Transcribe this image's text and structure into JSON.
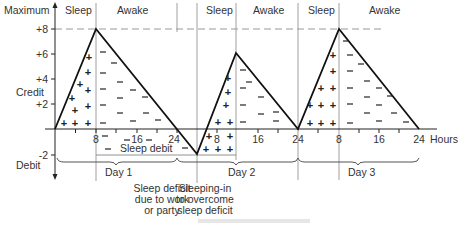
{
  "diagram": {
    "y_axis": {
      "top_label": "Maximum",
      "credit_label": "Credit",
      "debit_label": "Debit",
      "ticks": [
        {
          "label": "+8",
          "value": 8
        },
        {
          "label": "+6",
          "value": 6
        },
        {
          "label": "+4",
          "value": 4
        },
        {
          "label": "+2",
          "value": 2
        },
        {
          "label": "-2",
          "value": -2
        }
      ]
    },
    "x_axis": {
      "unit_label": "Hours",
      "tick_labels": [
        {
          "label": "8",
          "hour": 8
        },
        {
          "label": "16",
          "hour": 16
        },
        {
          "label": "24",
          "hour": 24
        },
        {
          "label": "8",
          "hour": 32
        },
        {
          "label": "16",
          "hour": 40
        },
        {
          "label": "24",
          "hour": 48
        },
        {
          "label": "8",
          "hour": 56
        },
        {
          "label": "16",
          "hour": 64
        },
        {
          "label": "24",
          "hour": 72
        }
      ]
    },
    "phase_labels": [
      {
        "label": "Sleep",
        "phase": "sleep",
        "day": 1
      },
      {
        "label": "Awake",
        "phase": "awake",
        "day": 1
      },
      {
        "label": "Sleep",
        "phase": "sleep",
        "day": 2
      },
      {
        "label": "Awake",
        "phase": "awake",
        "day": 2
      },
      {
        "label": "Sleep",
        "phase": "sleep",
        "day": 3
      },
      {
        "label": "Awake",
        "phase": "awake",
        "day": 3
      }
    ],
    "sleep_debit_label": "Sleep debit",
    "days": [
      {
        "label": "Day 1"
      },
      {
        "label": "Day 2"
      },
      {
        "label": "Day 3"
      }
    ],
    "annotations": [
      {
        "lines": [
          "Sleep deficit",
          "due to work",
          "or party"
        ]
      },
      {
        "lines": [
          "Sleeping-in",
          "to overcome",
          "sleep deficit"
        ]
      }
    ],
    "curve_points": [
      {
        "hour": 0,
        "value": 0
      },
      {
        "hour": 8,
        "value": 8
      },
      {
        "hour": 28,
        "value": -2
      },
      {
        "hour": 35.5,
        "value": 6
      },
      {
        "hour": 48,
        "value": 0
      },
      {
        "hour": 56,
        "value": 8
      },
      {
        "hour": 72,
        "value": 0
      }
    ],
    "legend_signs": {
      "plus": "+",
      "minus": "−"
    }
  }
}
